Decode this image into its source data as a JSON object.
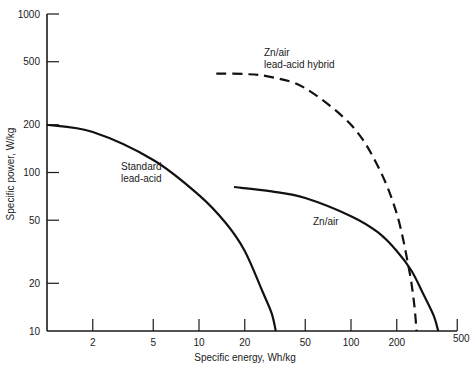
{
  "chart_data": {
    "type": "line",
    "title": "",
    "xlabel": "Specific energy, Wh/kg",
    "ylabel": "Specific power, W/kg",
    "xscale": "log",
    "yscale": "log",
    "xlim": [
      1,
      500
    ],
    "ylim": [
      10,
      1000
    ],
    "grid": false,
    "legend": "inline labels",
    "x_ticks": [
      2,
      5,
      10,
      20,
      50,
      100,
      200,
      500
    ],
    "y_ticks": [
      10,
      20,
      50,
      100,
      200,
      500,
      1000
    ],
    "series": [
      {
        "name": "Standard lead-acid",
        "label_lines": [
          "Standard",
          "lead-acid"
        ],
        "style": "solid",
        "points": [
          [
            1,
            200
          ],
          [
            2,
            180
          ],
          [
            5,
            120
          ],
          [
            10,
            72
          ],
          [
            15,
            48
          ],
          [
            20,
            32
          ],
          [
            26,
            18
          ],
          [
            30,
            13
          ],
          [
            32,
            10
          ]
        ]
      },
      {
        "name": "Zn/air",
        "label_lines": [
          "Zn/air"
        ],
        "style": "solid",
        "points": [
          [
            17,
            81
          ],
          [
            30,
            76
          ],
          [
            50,
            69
          ],
          [
            100,
            53
          ],
          [
            150,
            42
          ],
          [
            200,
            32
          ],
          [
            250,
            24
          ],
          [
            300,
            17
          ],
          [
            350,
            12.5
          ],
          [
            375,
            10
          ]
        ]
      },
      {
        "name": "Zn/air lead-acid hybrid",
        "label_lines": [
          "Zn/air",
          "lead-acid hybrid"
        ],
        "style": "dashed",
        "points": [
          [
            13,
            420
          ],
          [
            20,
            418
          ],
          [
            30,
            400
          ],
          [
            50,
            340
          ],
          [
            100,
            200
          ],
          [
            150,
            110
          ],
          [
            200,
            55
          ],
          [
            240,
            25
          ],
          [
            260,
            15
          ],
          [
            270,
            10
          ]
        ]
      }
    ]
  }
}
